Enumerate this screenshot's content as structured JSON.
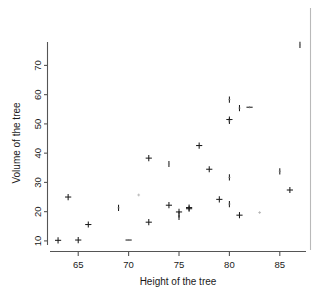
{
  "chart_data": {
    "type": "scatter",
    "title": "",
    "xlabel": "Height of the tree",
    "ylabel": "Volume of the tree",
    "xlim": [
      62.2,
      87.6
    ],
    "ylim": [
      8.6,
      78.0
    ],
    "xticks": [
      65,
      70,
      75,
      80,
      85
    ],
    "xtick_labels": [
      "65",
      "70",
      "75",
      "80",
      "85"
    ],
    "yticks": [
      10,
      20,
      30,
      40,
      50,
      60,
      70
    ],
    "ytick_labels": [
      "10",
      "20",
      "30",
      "40",
      "50",
      "60",
      "70"
    ],
    "grid": false,
    "legend": null,
    "marker": "plus",
    "marker_color": "#1d1d1d",
    "x": [
      70,
      65,
      63,
      72,
      81,
      83,
      66,
      75,
      80,
      75,
      79,
      76,
      76,
      69,
      75,
      74,
      85,
      86,
      71,
      64,
      78,
      80,
      74,
      72,
      77,
      81,
      82,
      80,
      80,
      80,
      87
    ],
    "y": [
      10.3,
      10.3,
      10.2,
      16.4,
      18.8,
      19.7,
      15.6,
      18.2,
      22.6,
      19.9,
      24.2,
      21.0,
      21.4,
      21.3,
      19.1,
      22.2,
      33.8,
      27.4,
      25.7,
      25.0,
      34.5,
      31.7,
      36.3,
      38.3,
      42.6,
      55.4,
      55.7,
      58.3,
      51.5,
      51.0,
      77.0
    ],
    "series_name": "trees"
  },
  "axes": {
    "x_title": "Height of the tree",
    "y_title": "Volume of the tree"
  }
}
